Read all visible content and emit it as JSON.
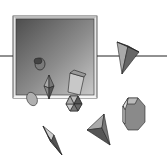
{
  "figure": {
    "shapes": [
      {
        "name": "cylinder",
        "location": "inside-frame"
      },
      {
        "name": "bipyramid",
        "location": "inside-frame"
      },
      {
        "name": "sphere",
        "location": "inside-frame"
      },
      {
        "name": "prism",
        "location": "inside-frame"
      },
      {
        "name": "hexagonal-pyramid",
        "location": "frame-edge"
      },
      {
        "name": "triangular-pyramid",
        "location": "outside-right"
      },
      {
        "name": "octagonal-prism",
        "location": "outside-right"
      },
      {
        "name": "tetrahedron",
        "location": "outside-bottom"
      },
      {
        "name": "bipyramid-small",
        "location": "outside-bottom-left"
      }
    ],
    "colors": {
      "frame": "#d8d8d8",
      "pane_dark": "#555555",
      "pane_light": "#bbbbbb",
      "solid_dark": "#4a4a4a",
      "solid_mid": "#8a8a8a",
      "solid_light": "#c4c4c4",
      "line": "#222222"
    }
  }
}
